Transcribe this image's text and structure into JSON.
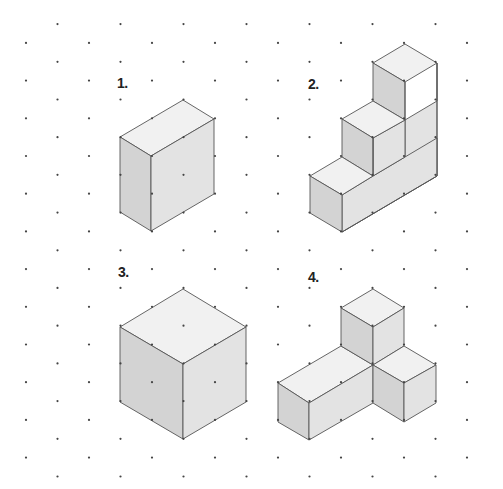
{
  "page": {
    "width": 503,
    "height": 489,
    "background": "#ffffff"
  },
  "colors": {
    "top_face": "#f1f1f1",
    "left_face": "#d3d3d3",
    "right_face": "#e3e3e3",
    "outline": "#555555",
    "grid_dot": "#444444"
  },
  "grid": {
    "type": "isometric-dot-grid",
    "x0": 26,
    "dx": 31.5,
    "cols": 15,
    "y0": 5.2,
    "dy": 18.85,
    "row_min": 1,
    "row_max": 25,
    "dot_radius": 1.1
  },
  "figures": [
    {
      "label": "1.",
      "label_pos": [
        117,
        76
      ],
      "description": "rectangular box 2 units deep, 1 wide, 2 tall",
      "faces": [
        {
          "type": "top",
          "points": [
            [
              183,
              100
            ],
            [
              214,
              119
            ],
            [
              151,
              156
            ],
            [
              120,
              137
            ]
          ]
        },
        {
          "type": "left",
          "points": [
            [
              120,
              137
            ],
            [
              151,
              156
            ],
            [
              151,
              231
            ],
            [
              120,
              212
            ]
          ]
        },
        {
          "type": "right",
          "points": [
            [
              151,
              156
            ],
            [
              214,
              119
            ],
            [
              214,
              194
            ],
            [
              151,
              231
            ]
          ]
        }
      ]
    },
    {
      "label": "2.",
      "label_pos": [
        308,
        77
      ],
      "description": "three-step staircase",
      "faces": [
        {
          "type": "right",
          "points": [
            [
              342,
              195
            ],
            [
              405,
              157
            ],
            [
              405,
              120
            ],
            [
              437,
              101
            ],
            [
              437,
              63
            ],
            [
              437,
              176
            ],
            [
              342,
              232
            ]
          ]
        },
        {
          "type": "right",
          "points": [
            [
              373,
              176
            ],
            [
              437,
              138
            ],
            [
              437,
              176
            ],
            [
              342,
              232
            ],
            [
              342,
              195
            ]
          ]
        },
        {
          "type": "right",
          "points": [
            [
              373,
              138
            ],
            [
              405,
              120
            ],
            [
              405,
              157
            ],
            [
              373,
              176
            ]
          ]
        },
        {
          "type": "top",
          "points": [
            [
              405,
              44
            ],
            [
              437,
              63
            ],
            [
              405,
              82
            ],
            [
              373,
              63
            ]
          ]
        },
        {
          "type": "left",
          "points": [
            [
              373,
              63
            ],
            [
              405,
              82
            ],
            [
              405,
              120
            ],
            [
              373,
              101
            ]
          ]
        },
        {
          "type": "top",
          "points": [
            [
              373,
              101
            ],
            [
              405,
              120
            ],
            [
              373,
              138
            ],
            [
              342,
              119
            ]
          ]
        },
        {
          "type": "left",
          "points": [
            [
              342,
              119
            ],
            [
              373,
              138
            ],
            [
              373,
              176
            ],
            [
              342,
              157
            ]
          ]
        },
        {
          "type": "top",
          "points": [
            [
              342,
              157
            ],
            [
              373,
              176
            ],
            [
              342,
              195
            ],
            [
              310,
              176
            ]
          ]
        },
        {
          "type": "left",
          "points": [
            [
              310,
              176
            ],
            [
              342,
              195
            ],
            [
              342,
              232
            ],
            [
              310,
              213
            ]
          ]
        }
      ],
      "edges": [
        [
          [
            405,
            82
          ],
          [
            405,
            120
          ]
        ],
        [
          [
            373,
            138
          ],
          [
            373,
            176
          ]
        ],
        [
          [
            437,
            63
          ],
          [
            437,
            176
          ]
        ],
        [
          [
            437,
            176
          ],
          [
            342,
            232
          ]
        ]
      ]
    },
    {
      "label": "3.",
      "label_pos": [
        118,
        265
      ],
      "description": "cube 2x2x2",
      "faces": [
        {
          "type": "top",
          "points": [
            [
              183,
              289
            ],
            [
              246,
              327
            ],
            [
              183,
              364
            ],
            [
              120,
              327
            ]
          ]
        },
        {
          "type": "left",
          "points": [
            [
              120,
              327
            ],
            [
              183,
              364
            ],
            [
              183,
              439
            ],
            [
              120,
              402
            ]
          ]
        },
        {
          "type": "right",
          "points": [
            [
              183,
              364
            ],
            [
              246,
              327
            ],
            [
              246,
              402
            ],
            [
              183,
              439
            ]
          ]
        }
      ]
    },
    {
      "label": "4.",
      "label_pos": [
        308,
        270
      ],
      "description": "L-shaped arrangement: long box, upright cube and side cube",
      "faces": [
        {
          "type": "top",
          "points": [
            [
              341,
              346
            ],
            [
              373,
              365
            ],
            [
              309,
              403
            ],
            [
              278,
              383
            ]
          ]
        },
        {
          "type": "left",
          "points": [
            [
              278,
              383
            ],
            [
              309,
              403
            ],
            [
              309,
              440
            ],
            [
              278,
              422
            ]
          ]
        },
        {
          "type": "right",
          "points": [
            [
              309,
              403
            ],
            [
              373,
              365
            ],
            [
              373,
              403
            ],
            [
              309,
              440
            ]
          ]
        },
        {
          "type": "top",
          "points": [
            [
              373,
              289
            ],
            [
              404,
              308
            ],
            [
              373,
              327
            ],
            [
              341,
              308
            ]
          ]
        },
        {
          "type": "left",
          "points": [
            [
              341,
              308
            ],
            [
              373,
              327
            ],
            [
              373,
              365
            ],
            [
              341,
              346
            ]
          ]
        },
        {
          "type": "right",
          "points": [
            [
              373,
              327
            ],
            [
              404,
              308
            ],
            [
              404,
              346
            ],
            [
              373,
              365
            ]
          ]
        },
        {
          "type": "top",
          "points": [
            [
              404,
              346
            ],
            [
              436,
              365
            ],
            [
              404,
              383
            ],
            [
              373,
              365
            ]
          ]
        },
        {
          "type": "left",
          "points": [
            [
              373,
              365
            ],
            [
              404,
              383
            ],
            [
              404,
              422
            ],
            [
              373,
              403
            ]
          ]
        },
        {
          "type": "right",
          "points": [
            [
              404,
              383
            ],
            [
              436,
              365
            ],
            [
              436,
              403
            ],
            [
              404,
              422
            ]
          ]
        }
      ]
    }
  ]
}
